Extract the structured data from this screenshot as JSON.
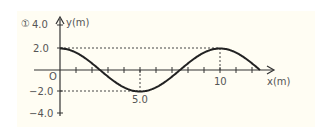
{
  "figure": {
    "label": "①",
    "colors": {
      "background": "#fffdf3",
      "curve": "#222222",
      "axis": "#333333",
      "text": "#555555"
    }
  },
  "chart_data": {
    "type": "line",
    "title": "",
    "xlabel": "x(m)",
    "ylabel": "y(m)",
    "xlim": [
      0,
      14
    ],
    "ylim": [
      -4.0,
      4.0
    ],
    "yticks": [
      "4.0",
      "2.0",
      "O",
      "−2.0",
      "−4.0"
    ],
    "xtick_labels": [
      "5.0",
      "10"
    ],
    "xtick_interval": 1,
    "grid": false,
    "series": [
      {
        "name": "wave",
        "description": "y = 2.0 cos(2πx/10)",
        "x": [
          0,
          1,
          2,
          2.5,
          3,
          4,
          5,
          6,
          7,
          7.5,
          8,
          9,
          10,
          11,
          12,
          12.5
        ],
        "y": [
          2.0,
          1.62,
          0.62,
          0.0,
          -0.62,
          -1.62,
          -2.0,
          -1.62,
          -0.62,
          0.0,
          0.62,
          1.62,
          2.0,
          1.62,
          0.62,
          0.0
        ]
      }
    ],
    "annotations": [
      {
        "type": "dashed-hline",
        "y": 2.0,
        "from_x": 0,
        "to_x": 10
      },
      {
        "type": "dashed-hline",
        "y": -2.0,
        "from_x": 0,
        "to_x": 5
      },
      {
        "type": "dashed-vline",
        "x": 5.0,
        "from_y": 0,
        "to_y": -2.0
      },
      {
        "type": "dashed-vline",
        "x": 10,
        "from_y": 0,
        "to_y": 2.0
      }
    ]
  }
}
